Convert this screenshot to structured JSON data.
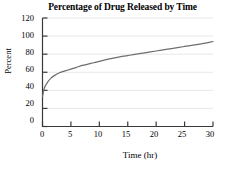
{
  "chart_data": {
    "type": "line",
    "title": "Percentage of Drug Released by Time",
    "xlabel": "Time (hr)",
    "ylabel": "Percent",
    "xlim": [
      0,
      30
    ],
    "ylim": [
      0,
      120
    ],
    "xticks": [
      0,
      5,
      10,
      15,
      20,
      25,
      30
    ],
    "yticks": [
      0,
      20,
      40,
      60,
      80,
      100,
      120
    ],
    "grid": "horizontal",
    "legend": "none",
    "series": [
      {
        "name": "Percentage released",
        "color": "#6e6e6e",
        "x": [
          0,
          0.25,
          0.5,
          1,
          1.5,
          2,
          3,
          4,
          5,
          6,
          7,
          8,
          9,
          10,
          12,
          14,
          15,
          16,
          18,
          20,
          22,
          24,
          25,
          26,
          28,
          30
        ],
        "y": [
          33,
          41,
          45,
          50,
          53.5,
          56,
          59.5,
          61.5,
          63.5,
          65.5,
          67.5,
          69,
          70.5,
          72,
          75,
          77.5,
          78.5,
          79.5,
          81.5,
          83.5,
          85.5,
          87.5,
          88.5,
          89.5,
          91.5,
          94
        ]
      }
    ]
  },
  "axis": {
    "ytick_labels": [
      "120",
      "100",
      "80",
      "60",
      "40",
      "20",
      "0"
    ],
    "xtick_labels": [
      "0",
      "5",
      "10",
      "15",
      "20",
      "25",
      "30"
    ]
  },
  "colors": {
    "curve": "#6e6e6e",
    "axis": "#3a3a3a",
    "grid": "#e2e2e2",
    "background": "#ffffff",
    "text": "#000000"
  }
}
